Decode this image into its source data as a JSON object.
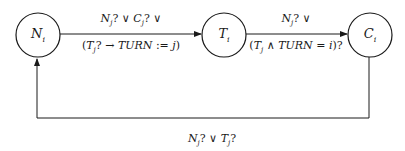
{
  "diagram": {
    "nodes": [
      {
        "id": "N",
        "base": "N",
        "sub": "i"
      },
      {
        "id": "T",
        "base": "T",
        "sub": "i"
      },
      {
        "id": "C",
        "base": "C",
        "sub": "i"
      }
    ],
    "edges": [
      {
        "from": "N",
        "to": "T",
        "label_top": "N_j? ∨ C_j? ∨",
        "label_bottom": "(T_j? → TURN := j)"
      },
      {
        "from": "T",
        "to": "C",
        "label_top": "N_j? ∨",
        "label_bottom": "(T_j ∧ TURN = i)?"
      },
      {
        "from": "C",
        "to": "N",
        "label": "N_j? ∨ T_j?"
      }
    ]
  }
}
